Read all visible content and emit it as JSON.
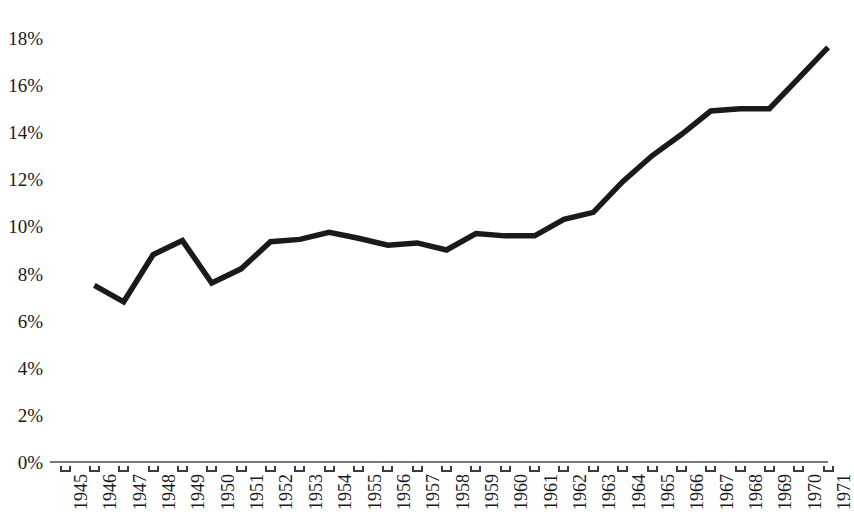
{
  "chart_data": {
    "type": "line",
    "title": "",
    "subtitle": "",
    "xlabel": "",
    "ylabel": "",
    "x": [
      1945,
      1946,
      1947,
      1948,
      1949,
      1950,
      1951,
      1952,
      1953,
      1954,
      1955,
      1956,
      1957,
      1958,
      1959,
      1960,
      1961,
      1962,
      1963,
      1964,
      1965,
      1966,
      1967,
      1968,
      1969,
      1970,
      1971
    ],
    "categories": [
      "1945",
      "1946",
      "1947",
      "1948",
      "1949",
      "1950",
      "1951",
      "1952",
      "1953",
      "1954",
      "1955",
      "1956",
      "1957",
      "1958",
      "1959",
      "1960",
      "1961",
      "1962",
      "1963",
      "1964",
      "1965",
      "1966",
      "1967",
      "1968",
      "1969",
      "1970",
      "1971"
    ],
    "values": [
      null,
      7.5,
      6.8,
      8.8,
      9.4,
      7.6,
      8.2,
      9.35,
      9.45,
      9.75,
      9.5,
      9.2,
      9.3,
      9.0,
      9.7,
      9.6,
      9.6,
      10.3,
      10.6,
      11.9,
      13.0,
      13.9,
      14.9,
      15.0,
      15.0,
      16.3,
      17.6
    ],
    "series": [
      {
        "name": "",
        "values": [
          null,
          7.5,
          6.8,
          8.8,
          9.4,
          7.6,
          8.2,
          9.35,
          9.45,
          9.75,
          9.5,
          9.2,
          9.3,
          9.0,
          9.7,
          9.6,
          9.6,
          10.3,
          10.6,
          11.9,
          13.0,
          13.9,
          14.9,
          15.0,
          15.0,
          16.3,
          17.6
        ],
        "color": "#1a1a1a",
        "line_width": 5.5
      }
    ],
    "ylim": [
      0,
      18
    ],
    "xlim": [
      1945,
      1971
    ],
    "y_ticks": [
      0,
      2,
      4,
      6,
      8,
      10,
      12,
      14,
      16,
      18
    ],
    "y_tick_labels": [
      "0%",
      "2%",
      "4%",
      "6%",
      "8%",
      "10%",
      "12%",
      "14%",
      "16%",
      "18%"
    ],
    "x_tick_labels": [
      "1945",
      "1946",
      "1947",
      "1948",
      "1949",
      "1950",
      "1951",
      "1952",
      "1953",
      "1954",
      "1955",
      "1956",
      "1957",
      "1958",
      "1959",
      "1960",
      "1961",
      "1962",
      "1963",
      "1964",
      "1965",
      "1966",
      "1967",
      "1968",
      "1969",
      "1970",
      "1971"
    ],
    "x_tick_label_rotation": -90,
    "grid": false,
    "legend": false,
    "legend_position": "none",
    "axis_color": "#4a4a4a",
    "background_color": "#ffffff",
    "y_axis_visible": false,
    "x_axis_visible": true,
    "unit": "%",
    "annotations": []
  },
  "layout": {
    "plot_left": 50,
    "plot_right": 828,
    "y_zero_px": 462,
    "y_top_px": 38,
    "x_first_tick_px": 65,
    "x_tick_step_px": 29.35
  }
}
